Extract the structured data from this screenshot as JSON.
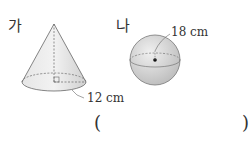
{
  "figures": {
    "cone": {
      "label": "가",
      "dimension": "12 cm"
    },
    "sphere": {
      "label": "나",
      "dimension": "18 cm"
    }
  },
  "answer": {
    "open": "(",
    "close": ")",
    "value": ""
  }
}
